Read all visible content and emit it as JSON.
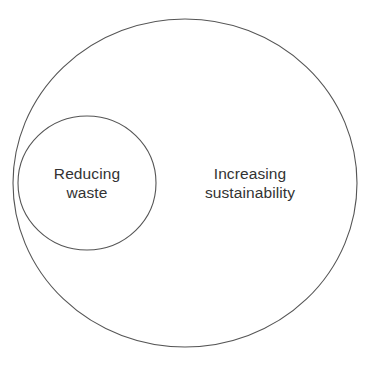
{
  "diagram": {
    "type": "euler-diagram",
    "background_color": "#ffffff",
    "stroke_color": "#555555",
    "stroke_width": 1,
    "text_color": "#333333",
    "canvas": {
      "width": 370,
      "height": 367
    },
    "shapes": [
      {
        "name": "outer-circle",
        "role": "containing-set",
        "cx": 185,
        "cy": 183,
        "rx": 172,
        "ry": 164,
        "fill": "none",
        "stroke": "#555555"
      },
      {
        "name": "inner-circle",
        "role": "contained-subset",
        "cx": 87,
        "cy": 183,
        "rx": 69,
        "ry": 67,
        "fill": "none",
        "stroke": "#555555"
      }
    ],
    "labels": {
      "outer": {
        "text": "Increasing\nsustainability",
        "line_1": "Increasing",
        "line_2": "sustainability",
        "cx": 250,
        "cy": 183
      },
      "inner": {
        "text": "Reducing\nwaste",
        "line_1": "Reducing",
        "line_2": "waste",
        "cx": 87,
        "cy": 183
      }
    }
  }
}
